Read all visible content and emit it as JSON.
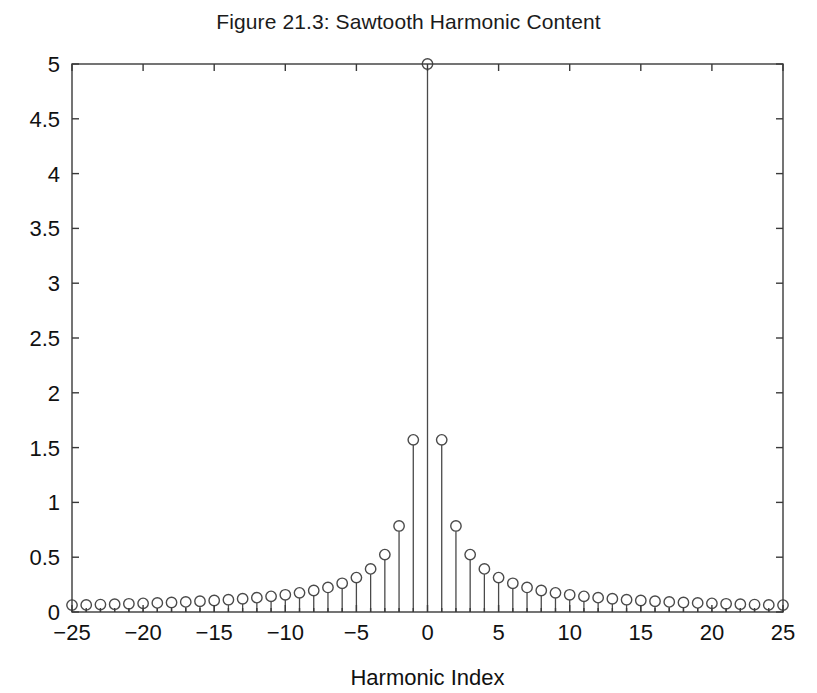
{
  "figure": {
    "title": "Figure 21.3: Sawtooth Harmonic Content",
    "background_color": "#ffffff",
    "axis_color": "#3a3a3a",
    "stem_color": "#4a4a4a",
    "text_color": "#111111"
  },
  "axes": {
    "x_title": "Harmonic Index",
    "y_title": "",
    "x_ticks": [
      "-25",
      "-20",
      "-15",
      "-10",
      "-5",
      "0",
      "5",
      "10",
      "15",
      "20",
      "25"
    ],
    "y_ticks": [
      "0",
      "0.5",
      "1",
      "1.5",
      "2",
      "2.5",
      "3",
      "3.5",
      "4",
      "4.5",
      "5"
    ]
  },
  "chart_data": {
    "type": "scatter",
    "plot_style": "stem",
    "title": "Figure 21.3: Sawtooth Harmonic Content",
    "xlabel": "Harmonic Index",
    "ylabel": "",
    "xlim": [
      -25,
      25
    ],
    "ylim": [
      0,
      5
    ],
    "xticks": [
      -25,
      -20,
      -15,
      -10,
      -5,
      0,
      5,
      10,
      15,
      20,
      25
    ],
    "yticks": [
      0,
      0.5,
      1,
      1.5,
      2,
      2.5,
      3,
      3.5,
      4,
      4.5,
      5
    ],
    "grid": false,
    "legend": null,
    "marker": "open-circle",
    "series": [
      {
        "name": "Sawtooth harmonic magnitude",
        "x": [
          -25,
          -24,
          -23,
          -22,
          -21,
          -20,
          -19,
          -18,
          -17,
          -16,
          -15,
          -14,
          -13,
          -12,
          -11,
          -10,
          -9,
          -8,
          -7,
          -6,
          -5,
          -4,
          -3,
          -2,
          -1,
          0,
          1,
          2,
          3,
          4,
          5,
          6,
          7,
          8,
          9,
          10,
          11,
          12,
          13,
          14,
          15,
          16,
          17,
          18,
          19,
          20,
          21,
          22,
          23,
          24,
          25
        ],
        "y": [
          0.063,
          0.065,
          0.068,
          0.071,
          0.075,
          0.079,
          0.083,
          0.087,
          0.092,
          0.098,
          0.105,
          0.112,
          0.121,
          0.131,
          0.143,
          0.157,
          0.175,
          0.196,
          0.224,
          0.262,
          0.314,
          0.393,
          0.524,
          0.785,
          1.571,
          5.0,
          1.571,
          0.785,
          0.524,
          0.393,
          0.314,
          0.262,
          0.224,
          0.196,
          0.175,
          0.157,
          0.143,
          0.131,
          0.121,
          0.112,
          0.105,
          0.098,
          0.092,
          0.087,
          0.083,
          0.079,
          0.075,
          0.071,
          0.068,
          0.065,
          0.063
        ]
      }
    ]
  }
}
